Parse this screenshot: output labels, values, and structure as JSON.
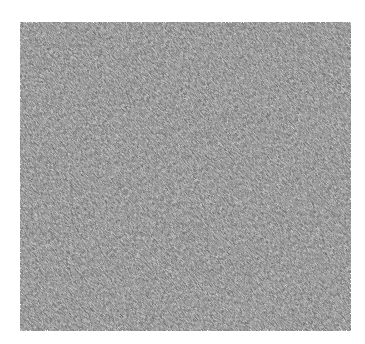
{
  "image": {
    "description": "Grayscale noise texture square with diagonal streak pattern",
    "colors": {
      "background": "#ffffff",
      "texture_mid": "#a8a8a8",
      "texture_dark": "#777777",
      "texture_light": "#e0e0e0"
    }
  }
}
